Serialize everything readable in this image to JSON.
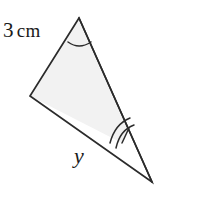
{
  "figure": {
    "kind": "geometry-diagram",
    "canvas": {
      "width": 213,
      "height": 216,
      "background": "#ffffff"
    },
    "colors": {
      "stroke": "#2b2b2b",
      "fill": "#f2f2f2",
      "arc": "#2b2b2b",
      "text": "#1a1a1a"
    },
    "vertices": [
      {
        "name": "apex-top",
        "x": 79,
        "y": 18
      },
      {
        "name": "vertex-left",
        "x": 30,
        "y": 96
      },
      {
        "name": "apex-bottom-right",
        "x": 152,
        "y": 182
      }
    ],
    "interior_quadrilateral": [
      {
        "x": 79,
        "y": 18
      },
      {
        "x": 30,
        "y": 96
      },
      {
        "x": 122,
        "y": 143
      },
      {
        "x": 129,
        "y": 128
      }
    ],
    "angle_markers": [
      {
        "name": "angle-top",
        "at": "apex-top",
        "arcs": 1
      },
      {
        "name": "angle-bottom-right",
        "at": "apex-bottom-right",
        "arcs": 2
      }
    ],
    "labels": {
      "side_left": {
        "value": "3",
        "unit": "cm",
        "text": "3 cm"
      },
      "side_bottom": {
        "value": "y",
        "text": "y"
      }
    }
  }
}
